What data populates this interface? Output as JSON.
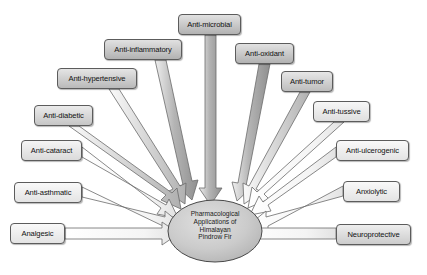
{
  "diagram": {
    "type": "radial-fan",
    "title_hub": {
      "lines": [
        "Pharmacological",
        "Applications of",
        "Himalayan",
        "Pindrow Fir"
      ],
      "shape": "ellipse",
      "fill": "#c9c9c9",
      "stroke": "#4a4a4a"
    },
    "colors": {
      "box_fill_dark": "#bdbdbd",
      "box_fill_mid": "#d6d6d6",
      "box_fill_light": "#f2f2f2",
      "box_stroke": "#5c5c5c",
      "arrow_fill_dark": "#a9a9a9",
      "arrow_fill_light": "#f4f4f4",
      "arrow_stroke": "#6b6b6b",
      "background": "#ffffff"
    },
    "nodes": [
      {
        "id": "anti-microbial",
        "label": "Anti-microbial",
        "x": 178,
        "y": 14,
        "w": 63,
        "h": 21,
        "font": 7.6,
        "fill": "#bdbdbd"
      },
      {
        "id": "anti-inflammatory",
        "label": "Anti-inflammatory",
        "x": 104,
        "y": 39,
        "w": 78,
        "h": 21,
        "font": 7.6,
        "fill": "#bdbdbd"
      },
      {
        "id": "anti-oxidant",
        "label": "Anti-oxidant",
        "x": 235,
        "y": 43,
        "w": 59,
        "h": 21,
        "font": 7.6,
        "fill": "#bdbdbd"
      },
      {
        "id": "anti-hypertensive",
        "label": "Anti-hypertensive",
        "x": 57,
        "y": 68,
        "w": 80,
        "h": 21,
        "font": 7.6,
        "fill": "#c5c5c5"
      },
      {
        "id": "anti-tumor",
        "label": "Anti-tumor",
        "x": 281,
        "y": 71,
        "w": 52,
        "h": 21,
        "font": 7.6,
        "fill": "#c9c9c9"
      },
      {
        "id": "anti-diabetic",
        "label": "Anti-diabetic",
        "x": 34,
        "y": 105,
        "w": 59,
        "h": 21,
        "font": 7.6,
        "fill": "#d2d2d2"
      },
      {
        "id": "anti-tussive",
        "label": "Anti-tussive",
        "x": 313,
        "y": 101,
        "w": 57,
        "h": 21,
        "font": 7.6,
        "fill": "#ededed"
      },
      {
        "id": "anti-cataract",
        "label": "Anti-cataract",
        "x": 21,
        "y": 140,
        "w": 61,
        "h": 21,
        "font": 7.6,
        "fill": "#e8e8e8"
      },
      {
        "id": "anti-ulcerogenic",
        "label": "Anti-ulcerogenic",
        "x": 336,
        "y": 140,
        "w": 73,
        "h": 21,
        "font": 7.6,
        "fill": "#f2f2f2"
      },
      {
        "id": "anti-asthmatic",
        "label": "Anti-asthmatic",
        "x": 14,
        "y": 182,
        "w": 68,
        "h": 21,
        "font": 7.6,
        "fill": "#f2f2f2"
      },
      {
        "id": "anxiolytic",
        "label": "Anxiolytic",
        "x": 343,
        "y": 181,
        "w": 57,
        "h": 21,
        "font": 7.6,
        "fill": "#f2f2f2"
      },
      {
        "id": "analgesic",
        "label": "Analgesic",
        "x": 10,
        "y": 223,
        "w": 55,
        "h": 21,
        "font": 7.6,
        "fill": "#f2f2f2"
      },
      {
        "id": "neuroprotective",
        "label": "Neuroprotective",
        "x": 336,
        "y": 224,
        "w": 75,
        "h": 21,
        "font": 7.6,
        "fill": "#d9d9d9"
      }
    ],
    "hub_geometry": {
      "cx": 215,
      "cy": 231,
      "rx": 47,
      "ry": 31
    }
  }
}
